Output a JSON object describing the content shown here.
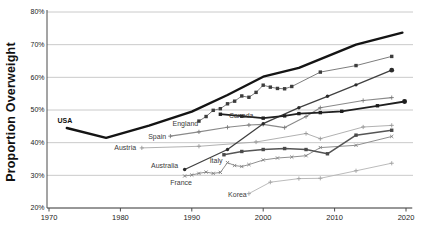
{
  "chart_data": {
    "type": "line",
    "title": "",
    "xlabel": "",
    "ylabel": "Proportion Overweight",
    "xlim": [
      1970,
      2020
    ],
    "ylim": [
      20,
      80
    ],
    "grid": "horizontal",
    "legend_position": "inline-labels",
    "colors": {
      "background": "#ffffff",
      "gridline": "#bdbdbd",
      "spine": "#4a4a4a",
      "tick_text": "#1a1a1a"
    },
    "xticks": [
      {
        "v": 1970,
        "label": "1970"
      },
      {
        "v": 1980,
        "label": "1980"
      },
      {
        "v": 1990,
        "label": "1990"
      },
      {
        "v": 2000,
        "label": "2000"
      },
      {
        "v": 2010,
        "label": "2010"
      },
      {
        "v": 2020,
        "label": "2020"
      }
    ],
    "yticks": [
      {
        "v": 20,
        "label": "20%"
      },
      {
        "v": 30,
        "label": "30%"
      },
      {
        "v": 40,
        "label": "40%"
      },
      {
        "v": 50,
        "label": "50%"
      },
      {
        "v": 60,
        "label": "60%"
      },
      {
        "v": 70,
        "label": "70%"
      },
      {
        "v": 80,
        "label": "80%"
      }
    ],
    "series": [
      {
        "name": "Austria",
        "color": "#a8a8a8",
        "width": 0.9,
        "marker": "plus",
        "marker_color": "#989898",
        "label": {
          "text": "Austria",
          "year": 1982.2,
          "value": 37.8,
          "align": "end",
          "bold": false
        },
        "points": [
          [
            1983,
            38.4
          ],
          [
            1991,
            38.9
          ],
          [
            1999,
            40.2
          ],
          [
            2006,
            42.8
          ],
          [
            2008,
            41.2
          ],
          [
            2014,
            44.8
          ],
          [
            2018,
            45.3
          ]
        ]
      },
      {
        "name": "Korea",
        "color": "#b3b3b3",
        "width": 0.9,
        "marker": "plus",
        "marker_color": "#a3a3a3",
        "label": {
          "text": "Korea",
          "year": 1997.7,
          "value": 23.4,
          "align": "end",
          "bold": false
        },
        "points": [
          [
            1998,
            24.4
          ],
          [
            2001,
            27.9
          ],
          [
            2005,
            29.0
          ],
          [
            2008,
            29.1
          ],
          [
            2013,
            31.4
          ],
          [
            2018,
            33.7
          ]
        ]
      },
      {
        "name": "France",
        "color": "#909090",
        "width": 1.0,
        "marker": "x",
        "marker_color": "#808080",
        "label": {
          "text": "France",
          "year": 1988.5,
          "value": 27.0,
          "align": "middle",
          "bold": false
        },
        "points": [
          [
            1989,
            29.8
          ],
          [
            1990,
            30.1
          ],
          [
            1991,
            30.6
          ],
          [
            1992,
            31.0
          ],
          [
            1993,
            30.6
          ],
          [
            1994,
            30.9
          ],
          [
            1995,
            33.9
          ],
          [
            1996,
            33.0
          ],
          [
            1997,
            32.7
          ],
          [
            1998,
            33.3
          ],
          [
            2000,
            34.7
          ],
          [
            2002,
            35.3
          ],
          [
            2004,
            35.6
          ],
          [
            2006,
            36.0
          ],
          [
            2008,
            38.5
          ],
          [
            2013,
            39.2
          ],
          [
            2018,
            41.9
          ]
        ]
      },
      {
        "name": "Spain",
        "color": "#8a8a8a",
        "width": 1.1,
        "marker": "plus",
        "marker_color": "#7a7a7a",
        "label": {
          "text": "Spain",
          "year": 1986.4,
          "value": 41.1,
          "align": "end",
          "bold": false
        },
        "points": [
          [
            1987,
            42.0
          ],
          [
            1991,
            43.3
          ],
          [
            1995,
            44.7
          ],
          [
            1998,
            45.4
          ],
          [
            2000,
            45.6
          ],
          [
            2003,
            44.6
          ],
          [
            2006,
            48.0
          ],
          [
            2008,
            50.7
          ],
          [
            2014,
            52.9
          ],
          [
            2018,
            53.8
          ]
        ]
      },
      {
        "name": "Italy",
        "color": "#555555",
        "width": 1.6,
        "marker": "square",
        "marker_color": "#4a4a4a",
        "label": {
          "text": "Italy",
          "year": 1993.4,
          "value": 33.8,
          "align": "middle",
          "bold": false
        },
        "points": [
          [
            1994.5,
            36.3
          ],
          [
            1997,
            37.3
          ],
          [
            2000,
            37.9
          ],
          [
            2003,
            38.2
          ],
          [
            2006,
            37.9
          ],
          [
            2009,
            36.6
          ],
          [
            2013,
            42.3
          ],
          [
            2018,
            43.8
          ]
        ]
      },
      {
        "name": "England",
        "color": "#7d7d7d",
        "width": 1.0,
        "marker": "square",
        "marker_color": "#3d3d3d",
        "label": {
          "text": "England",
          "year": 1990.9,
          "value": 45.1,
          "align": "end",
          "bold": false
        },
        "points": [
          [
            1991,
            46.6
          ],
          [
            1992,
            48.0
          ],
          [
            1993,
            49.9
          ],
          [
            1994,
            50.4
          ],
          [
            1995,
            51.9
          ],
          [
            1996,
            52.7
          ],
          [
            1997,
            54.3
          ],
          [
            1998,
            53.9
          ],
          [
            1999,
            55.4
          ],
          [
            2000,
            57.6
          ],
          [
            2001,
            57.0
          ],
          [
            2002,
            56.6
          ],
          [
            2003,
            56.5
          ],
          [
            2004,
            57.2
          ],
          [
            2008,
            61.6
          ],
          [
            2013,
            63.6
          ],
          [
            2018,
            66.4
          ]
        ]
      },
      {
        "name": "Australia",
        "color": "#404040",
        "width": 1.3,
        "marker": "circle",
        "marker_color": "#2b2b2b",
        "end_dot": true,
        "label": {
          "text": "Australia",
          "year": 1988.1,
          "value": 32.25,
          "align": "end",
          "bold": false
        },
        "points": [
          [
            1989,
            31.8
          ],
          [
            1995,
            37.9
          ],
          [
            2000,
            45.8
          ],
          [
            2005,
            50.7
          ],
          [
            2009,
            54.2
          ],
          [
            2013,
            57.7
          ],
          [
            2018,
            62.2
          ]
        ]
      },
      {
        "name": "Canada",
        "color": "#1f1f1f",
        "width": 1.8,
        "marker": "square",
        "marker_color": "#1f1f1f",
        "end_dot": true,
        "label": {
          "text": "Canada",
          "year": 1995.2,
          "value": 47.6,
          "align": "start",
          "bold": false
        },
        "points": [
          [
            1994,
            48.7
          ],
          [
            1997,
            48.1
          ],
          [
            2000,
            47.5
          ],
          [
            2003,
            48.2
          ],
          [
            2005,
            48.9
          ],
          [
            2008,
            49.2
          ],
          [
            2011,
            49.6
          ],
          [
            2016,
            51.3
          ],
          [
            2019.8,
            52.6
          ]
        ]
      },
      {
        "name": "USA",
        "color": "#141414",
        "width": 2.4,
        "marker": "none",
        "marker_color": "#141414",
        "label": {
          "text": "USA",
          "year": 1971.2,
          "value": 45.9,
          "align": "start",
          "bold": true
        },
        "points": [
          [
            1972.5,
            44.5
          ],
          [
            1978,
            41.5
          ],
          [
            1984,
            45.2
          ],
          [
            1990,
            49.5
          ],
          [
            1995,
            54.6
          ],
          [
            2000,
            60.2
          ],
          [
            2005,
            62.9
          ],
          [
            2013,
            70.0
          ],
          [
            2019.5,
            73.7
          ]
        ]
      }
    ]
  }
}
